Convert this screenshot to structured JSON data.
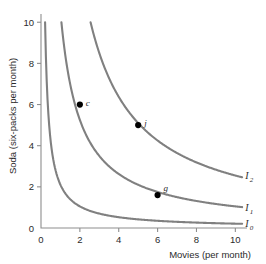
{
  "chart_data": {
    "type": "line",
    "title": "",
    "xlabel": "Movies (per month)",
    "ylabel": "Soda (six-packs per month)",
    "xlim": [
      0,
      10.6
    ],
    "ylim": [
      0,
      10.4
    ],
    "xticks": [
      "0",
      "2",
      "4",
      "6",
      "8",
      "10"
    ],
    "xtick_values": [
      0,
      2,
      4,
      6,
      8,
      10
    ],
    "yticks": [
      "0",
      "2",
      "4",
      "6",
      "8",
      "10"
    ],
    "ytick_values": [
      0,
      2,
      4,
      6,
      8,
      10
    ],
    "grid": false,
    "legend": "inline-right",
    "curve_color": "#808080",
    "point_color": "#000000",
    "axis_color": "#8e8e8e",
    "series": [
      {
        "name": "I0",
        "label": "I",
        "sublabel": "0",
        "k": 2.1,
        "label_x": 10.35,
        "label_y": 0.05,
        "x_start": 0.21,
        "x_end": 10.35
      },
      {
        "name": "I1",
        "label": "I",
        "sublabel": "1",
        "k": 10.5,
        "label_x": 10.35,
        "label_y": 0.82,
        "x_start": 1.05,
        "x_end": 10.35
      },
      {
        "name": "I2",
        "label": "I",
        "sublabel": "2",
        "k": 25.5,
        "label_x": 10.35,
        "label_y": 2.4,
        "x_start": 2.55,
        "x_end": 10.35
      }
    ],
    "points": [
      {
        "label": "c",
        "x": 2,
        "y": 6,
        "curve": "I1",
        "label_dx": 6,
        "label_dy": 1
      },
      {
        "label": "j",
        "x": 5,
        "y": 5,
        "curve": "I2",
        "label_dx": 6,
        "label_dy": 1
      },
      {
        "label": "g",
        "x": 6,
        "y": 1.6,
        "curve": "I1",
        "label_dx": 6,
        "label_dy": -4
      }
    ]
  }
}
